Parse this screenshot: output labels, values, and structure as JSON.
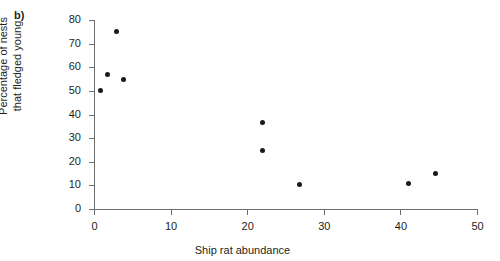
{
  "panel": {
    "label": "b)"
  },
  "chart_data": {
    "type": "scatter",
    "title": "",
    "xlabel": "Ship rat abundance",
    "ylabel": "Percentage of nests that fledged young",
    "ylabel_lines": [
      "Percentage of nests",
      "that fledged young"
    ],
    "xlim": [
      0,
      50
    ],
    "ylim": [
      0,
      80
    ],
    "xticks": [
      0,
      10,
      20,
      30,
      40,
      50
    ],
    "yticks": [
      0,
      10,
      20,
      30,
      40,
      50,
      60,
      70,
      80
    ],
    "xtick_labels": [
      "0",
      "10",
      "20",
      "30",
      "40",
      "50"
    ],
    "ytick_labels": [
      "0",
      "10",
      "20",
      "30",
      "40",
      "50",
      "60",
      "70",
      "80"
    ],
    "grid": false,
    "legend": null,
    "marker": "filled-circle",
    "marker_color": "#1a1a1a",
    "axis_color": "#6d6e70",
    "points": [
      {
        "x": 0.9,
        "y": 50.2
      },
      {
        "x": 1.8,
        "y": 57.0
      },
      {
        "x": 2.9,
        "y": 75.1
      },
      {
        "x": 3.8,
        "y": 54.9
      },
      {
        "x": 22.0,
        "y": 36.8
      },
      {
        "x": 22.0,
        "y": 24.7
      },
      {
        "x": 26.8,
        "y": 10.5
      },
      {
        "x": 41.0,
        "y": 10.6
      },
      {
        "x": 44.6,
        "y": 15.1
      }
    ]
  }
}
